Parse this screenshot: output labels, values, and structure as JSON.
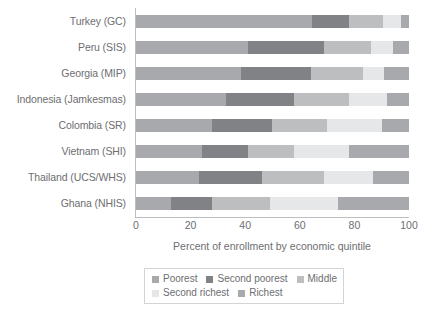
{
  "chart_data": {
    "type": "bar",
    "orientation": "horizontal",
    "stacked": true,
    "title": "",
    "subtitle": "",
    "xlabel": "Percent of enrollment by economic quintile",
    "ylabel": "",
    "xlim": [
      0,
      100
    ],
    "xticks": [
      0,
      20,
      40,
      60,
      80,
      100
    ],
    "xtick_labels": [
      "0",
      "20",
      "40",
      "60",
      "80",
      "100"
    ],
    "grid": false,
    "legend_position": "bottom",
    "categories": [
      "Turkey (GC)",
      "Peru (SIS)",
      "Georgia (MIP)",
      "Indonesia (Jamkesmas)",
      "Colombia (SR)",
      "Vietnam (SHI)",
      "Thailand (UCS/WHS)",
      "Ghana (NHIS)"
    ],
    "series": [
      {
        "name": "Poorest",
        "color": "#a7a9ac",
        "values": [
          64.5,
          41.0,
          38.5,
          33.0,
          28.0,
          24.0,
          23.0,
          13.0
        ]
      },
      {
        "name": "Second poorest",
        "color": "#808285",
        "values": [
          13.5,
          28.0,
          25.5,
          25.0,
          22.0,
          17.0,
          23.0,
          15.0
        ]
      },
      {
        "name": "Middle",
        "color": "#bcbec0",
        "values": [
          12.5,
          17.0,
          19.0,
          20.0,
          20.0,
          17.0,
          23.0,
          21.0
        ]
      },
      {
        "name": "Second richest",
        "color": "#e6e7e8",
        "values": [
          6.5,
          8.0,
          8.0,
          14.0,
          20.0,
          20.0,
          18.0,
          25.0
        ]
      },
      {
        "name": "Richest",
        "color": "#a7a9ac",
        "values": [
          3.0,
          6.0,
          9.0,
          8.0,
          10.0,
          22.0,
          13.0,
          26.0
        ]
      }
    ]
  },
  "legend": {
    "rows": [
      [
        "Poorest",
        "Second poorest",
        "Middle"
      ],
      [
        "Second richest",
        "Richest"
      ]
    ]
  },
  "colors": {
    "poorest": "#a7a9ac",
    "second_poorest": "#808285",
    "middle": "#bcbec0",
    "second_richest": "#e6e7e8",
    "richest": "#a7a9ac",
    "axis": "#bcbec0",
    "text": "#6d6e71",
    "background": "#ffffff"
  }
}
